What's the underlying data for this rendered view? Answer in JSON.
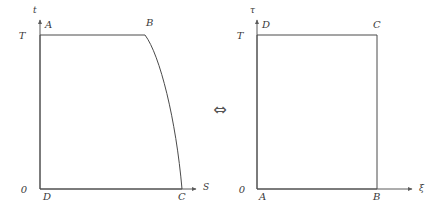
{
  "figure": {
    "background_color": "#ffffff",
    "stroke_color": "#4a4a4a",
    "relation_symbol": "⇔",
    "relation_name": "equivalence-double-arrow"
  },
  "left_diagram": {
    "name": "entropy-temperature-carnot-cycle",
    "y_axis_label": "t",
    "x_axis_label": "S",
    "origin_label": "0",
    "y_tick_label": "T",
    "vertices": [
      {
        "id": "A",
        "label": "A",
        "x_px": 40,
        "y_px": 35
      },
      {
        "id": "B",
        "label": "B",
        "x_px": 145,
        "y_px": 35
      },
      {
        "id": "C",
        "label": "C",
        "x_px": 182,
        "y_px": 189
      },
      {
        "id": "D",
        "label": "D",
        "x_px": 40,
        "y_px": 189
      }
    ],
    "edges": [
      {
        "from": "A",
        "to": "B",
        "shape": "straight"
      },
      {
        "from": "B",
        "to": "C",
        "shape": "curved"
      },
      {
        "from": "C",
        "to": "D",
        "shape": "straight"
      },
      {
        "from": "D",
        "to": "A",
        "shape": "straight"
      }
    ]
  },
  "right_diagram": {
    "name": "rectified-coordinates-rectangle",
    "y_axis_label": "τ",
    "x_axis_label": "ξ",
    "origin_label": "0",
    "y_tick_label": "T",
    "vertices": [
      {
        "id": "D",
        "label": "D",
        "x_px": 257,
        "y_px": 35
      },
      {
        "id": "C",
        "label": "C",
        "x_px": 377,
        "y_px": 35
      },
      {
        "id": "B",
        "label": "B",
        "x_px": 377,
        "y_px": 189
      },
      {
        "id": "A",
        "label": "A",
        "x_px": 257,
        "y_px": 189
      }
    ],
    "edges": [
      {
        "from": "D",
        "to": "C",
        "shape": "straight"
      },
      {
        "from": "C",
        "to": "B",
        "shape": "straight"
      },
      {
        "from": "B",
        "to": "A",
        "shape": "straight"
      },
      {
        "from": "A",
        "to": "D",
        "shape": "straight"
      }
    ]
  }
}
